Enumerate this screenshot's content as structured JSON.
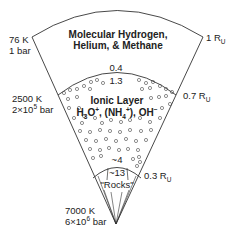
{
  "diagram": {
    "type": "planet-interior-wedge",
    "layers": {
      "outer": {
        "name_line1": "Molecular Hydrogen,",
        "name_line2": "Helium, & Methane",
        "radius_label": "1 R",
        "radius_sub": "U"
      },
      "ionic": {
        "name_line1": "Ionic Layer",
        "formula": {
          "h3o_a": "H",
          "h3o_sub": "3",
          "h3o_b": "O",
          "h3o_sup": "+",
          "nh4_a": ", (NH",
          "nh4_sub": "4",
          "nh4_sup": "+",
          "oh_a": "), OH",
          "oh_sup": "−"
        },
        "radius_label": "0.7 R",
        "radius_sub": "U",
        "density_top": "0.4",
        "density_top2": "1.3",
        "density_bottom": "~4"
      },
      "rocks": {
        "name": "\"Rocks\"",
        "density": "~13",
        "radius_label": "0.3 R",
        "radius_sub": "U"
      }
    },
    "conditions": [
      {
        "temp": "76 K",
        "pressure_a": "1 bar",
        "pressure_sup": "",
        "pressure_b": ""
      },
      {
        "temp": "2500 K",
        "pressure_a": "2×10",
        "pressure_sup": "5",
        "pressure_b": " bar"
      },
      {
        "temp": "7000 K",
        "pressure_a": "6×10",
        "pressure_sup": "6",
        "pressure_b": " bar"
      }
    ],
    "colors": {
      "line": "#333333",
      "text": "#222222",
      "background": "#ffffff"
    }
  }
}
